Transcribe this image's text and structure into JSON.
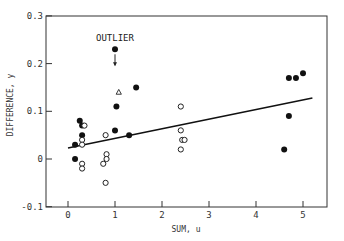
{
  "chart_data": {
    "type": "scatter",
    "title": "",
    "xlabel": "SUM, u",
    "ylabel": "DIFFERENCE, y",
    "xlim": [
      -0.45,
      5.5
    ],
    "ylim": [
      -0.1,
      0.3
    ],
    "x_ticks": [
      0,
      1,
      2,
      3,
      4,
      5
    ],
    "x_tick_labels": [
      "0",
      "1",
      "2",
      "3",
      "4",
      "5"
    ],
    "y_ticks": [
      -0.1,
      0,
      0.1,
      0.2,
      0.3
    ],
    "y_tick_labels": [
      "-0.1",
      "0",
      "0.1",
      "0.2",
      "0.3"
    ],
    "grid": false,
    "legend": null,
    "series": [
      {
        "name": "filled",
        "marker": "filled-circle",
        "points": [
          [
            0.25,
            0.08
          ],
          [
            0.3,
            0.07
          ],
          [
            0.3,
            0.05
          ],
          [
            0.15,
            0.03
          ],
          [
            0.15,
            0.0
          ],
          [
            1.0,
            0.23
          ],
          [
            1.45,
            0.15
          ],
          [
            1.03,
            0.11
          ],
          [
            1.0,
            0.06
          ],
          [
            1.3,
            0.05
          ],
          [
            4.7,
            0.17
          ],
          [
            4.85,
            0.17
          ],
          [
            5.0,
            0.18
          ],
          [
            4.7,
            0.09
          ],
          [
            4.6,
            0.02
          ]
        ]
      },
      {
        "name": "open",
        "marker": "open-circle",
        "points": [
          [
            0.35,
            0.07
          ],
          [
            0.3,
            0.04
          ],
          [
            0.3,
            0.03
          ],
          [
            0.3,
            -0.01
          ],
          [
            0.3,
            -0.02
          ],
          [
            0.8,
            0.05
          ],
          [
            0.82,
            0.01
          ],
          [
            0.82,
            0.0
          ],
          [
            0.75,
            -0.01
          ],
          [
            0.8,
            -0.05
          ],
          [
            2.4,
            0.11
          ],
          [
            2.4,
            0.06
          ],
          [
            2.43,
            0.04
          ],
          [
            2.48,
            0.04
          ],
          [
            2.4,
            0.02
          ]
        ]
      },
      {
        "name": "triangle",
        "marker": "open-triangle",
        "points": [
          [
            1.08,
            0.14
          ]
        ]
      }
    ],
    "fit_line": {
      "x": [
        0,
        5.2
      ],
      "y": [
        0.023,
        0.128
      ]
    },
    "annotations": [
      {
        "text": "OUTLIER",
        "target": [
          1.0,
          0.23
        ],
        "arrow": "down"
      }
    ]
  }
}
